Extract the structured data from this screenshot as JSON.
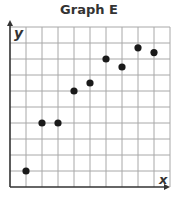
{
  "chart_data": {
    "type": "scatter",
    "title": "Graph E",
    "xlabel": "x",
    "ylabel": "y",
    "xlim": [
      0,
      10
    ],
    "ylim": [
      0,
      10
    ],
    "grid": true,
    "tick_labels": false,
    "points": [
      {
        "x": 1,
        "y": 1
      },
      {
        "x": 2,
        "y": 4
      },
      {
        "x": 3,
        "y": 4
      },
      {
        "x": 4,
        "y": 6
      },
      {
        "x": 5,
        "y": 6.5
      },
      {
        "x": 6,
        "y": 8
      },
      {
        "x": 7,
        "y": 7.5
      },
      {
        "x": 8,
        "y": 8.7
      },
      {
        "x": 9,
        "y": 8.4
      }
    ]
  },
  "colors": {
    "grid": "#a8a8a8",
    "axis": "#333333",
    "point": "#1a1a1a"
  }
}
